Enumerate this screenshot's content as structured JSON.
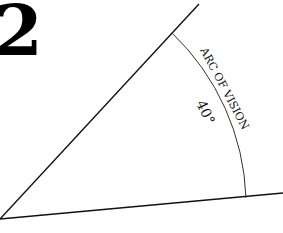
{
  "figure_number": "2",
  "labels": {
    "arc_label": "ARC OF VISION",
    "angle_label": "40°"
  },
  "angle_degrees": 40,
  "colors": {
    "ink": "#111111",
    "background": "#ffffff"
  }
}
